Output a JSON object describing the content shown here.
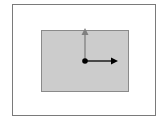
{
  "diagram": {
    "frame": {
      "stroke": "#7a7a7a",
      "fill": "#ffffff"
    },
    "rectangle": {
      "fill": "#cccccc",
      "stroke": "#8a8a8a"
    },
    "origin_point": {
      "x": 85,
      "y": 61,
      "r": 2.8,
      "color": "#000000"
    },
    "arrows": [
      {
        "name": "up-arrow",
        "direction": "up",
        "x1": 85,
        "y1": 61,
        "x2": 85,
        "y2": 29,
        "color": "#808080"
      },
      {
        "name": "right-arrow",
        "direction": "right",
        "x1": 85,
        "y1": 61,
        "x2": 117,
        "y2": 61,
        "color": "#000000"
      }
    ]
  }
}
